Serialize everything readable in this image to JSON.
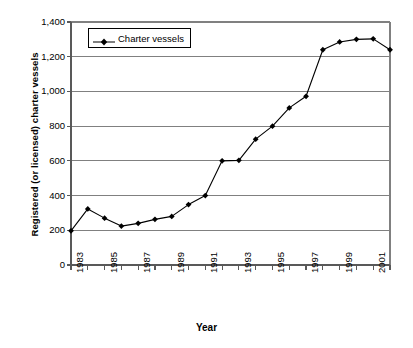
{
  "chart_data": {
    "type": "line",
    "title": "",
    "xlabel": "Year",
    "ylabel": "Registered (or licensed) charter vessels",
    "xlim": [
      1983,
      2002
    ],
    "ylim": [
      0,
      1400
    ],
    "grid": true,
    "legend_position": "top-left",
    "y_ticks": [
      "0",
      "200",
      "400",
      "600",
      "800",
      "1,000",
      "1,200",
      "1,400"
    ],
    "y_tick_values": [
      0,
      200,
      400,
      600,
      800,
      1000,
      1200,
      1400
    ],
    "x_ticks": [
      "1983",
      "1985",
      "1987",
      "1989",
      "1991",
      "1993",
      "1995",
      "1997",
      "1999",
      "2001"
    ],
    "x_tick_values": [
      1983,
      1985,
      1987,
      1989,
      1991,
      1993,
      1995,
      1997,
      1999,
      2001
    ],
    "x": [
      1983,
      1984,
      1985,
      1986,
      1987,
      1988,
      1989,
      1990,
      1991,
      1992,
      1993,
      1994,
      1995,
      1996,
      1997,
      1998,
      1999,
      2000,
      2001,
      2002
    ],
    "series": [
      {
        "name": "Charter vessels",
        "values": [
          197,
          323,
          270,
          224,
          240,
          263,
          280,
          348,
          400,
          600,
          603,
          725,
          800,
          905,
          972,
          1240,
          1285,
          1300,
          1303,
          1240
        ],
        "color": "#000000",
        "marker": "diamond"
      }
    ],
    "legend": [
      {
        "label": "Charter vessels"
      }
    ]
  },
  "axes": {
    "y_title": "Registered (or licensed) charter vessels",
    "x_title": "Year"
  }
}
